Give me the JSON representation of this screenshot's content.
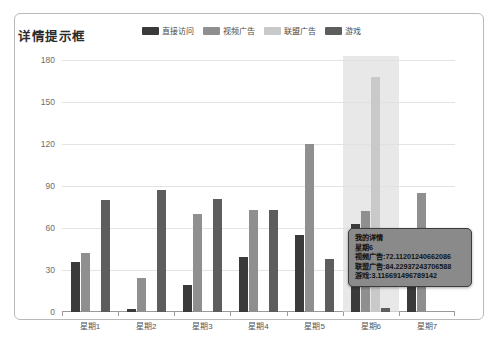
{
  "panel": {
    "name": "chart-panel"
  },
  "header": {
    "title": "详情提示框"
  },
  "legend": {
    "items": [
      {
        "label": "直接访问",
        "color": "#3a3a3a"
      },
      {
        "label": "视频广告",
        "color": "#8f8f8f"
      },
      {
        "label": "联盟广告",
        "color": "#c9c9c9"
      },
      {
        "label": "游戏",
        "color": "#5d5d5d"
      }
    ]
  },
  "tooltip": {
    "title": "我的详情",
    "axis_value": "星期6",
    "rows": [
      "视频广告:72.11201240662086",
      "联盟广告:84.22937243706588",
      "游戏:3.116691496789142"
    ]
  },
  "chart_data": {
    "type": "bar",
    "title": "详情提示框",
    "xlabel": "",
    "ylabel": "",
    "ylim": [
      0,
      180
    ],
    "yticks": [
      0,
      30,
      60,
      90,
      120,
      150,
      180
    ],
    "grid": true,
    "legend_position": "top-center",
    "categories": [
      "星期1",
      "星期2",
      "星期3",
      "星期4",
      "星期5",
      "星期6",
      "星期7"
    ],
    "highlighted_category": "星期6",
    "series": [
      {
        "name": "直接访问",
        "color": "#3a3a3a",
        "values": [
          36,
          2,
          19,
          39,
          55,
          63,
          21
        ]
      },
      {
        "name": "视频广告",
        "color": "#8f8f8f",
        "values": [
          42,
          24,
          70,
          73,
          120,
          72,
          85
        ]
      },
      {
        "name": "联盟广告",
        "color": "#c9c9c9",
        "values": [
          0,
          0,
          0,
          0,
          0,
          168,
          0
        ]
      },
      {
        "name": "游戏",
        "color": "#5d5d5d",
        "values": [
          80,
          87,
          81,
          73,
          38,
          3,
          0
        ]
      }
    ]
  }
}
